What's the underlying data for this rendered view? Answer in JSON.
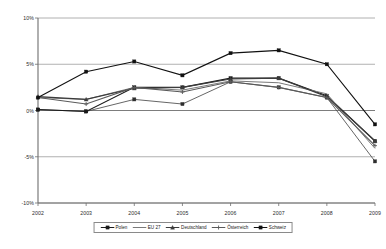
{
  "chart_data": {
    "type": "line",
    "title": "",
    "subtitle": "",
    "xlabel": "",
    "ylabel": "",
    "categories": [
      "2002",
      "2003",
      "2004",
      "2005",
      "2006",
      "2007",
      "2008",
      "2009"
    ],
    "x": [
      2002,
      2003,
      2004,
      2005,
      2006,
      2007,
      2008,
      2009
    ],
    "ylim": [
      -10,
      10
    ],
    "yticks": [
      10,
      5,
      0,
      -5,
      -10
    ],
    "ytick_labels": [
      "10%",
      "5%",
      "0%",
      "-5%",
      "-10%"
    ],
    "grid": true,
    "grid_axis": "y",
    "legend_position": "bottom",
    "series": [
      {
        "name": "Polen",
        "color": "#1a1a1a",
        "marker": "square",
        "values": [
          0.1,
          -0.1,
          2.5,
          2.5,
          3.5,
          3.5,
          1.6,
          -3.3
        ]
      },
      {
        "name": "EU 27",
        "color": "#7a7a7a",
        "marker": "none",
        "values": [
          1.4,
          1.2,
          2.5,
          2.2,
          3.2,
          3.0,
          1.8,
          -4.1
        ]
      },
      {
        "name": "Deutschland",
        "color": "#3c3c3c",
        "marker": "triangle",
        "values": [
          1.5,
          1.2,
          2.4,
          2.5,
          3.4,
          3.5,
          1.5,
          -3.3
        ]
      },
      {
        "name": "Österreich",
        "color": "#5a5a5a",
        "marker": "cross",
        "values": [
          1.4,
          0.7,
          2.5,
          2.0,
          3.1,
          2.5,
          1.4,
          -3.8
        ]
      },
      {
        "name": "Schweiz",
        "color": "#111111",
        "marker": "square",
        "values": [
          1.4,
          4.2,
          5.3,
          3.8,
          6.2,
          6.5,
          5.0,
          -1.5
        ]
      }
    ],
    "low_series": {
      "name": "Österreich-low",
      "values": [
        0.1,
        -0.1,
        1.2,
        0.7,
        3.1,
        2.5,
        1.4,
        -5.5
      ]
    }
  },
  "legend": {
    "entries": [
      {
        "label": "Polen"
      },
      {
        "label": "EU 27"
      },
      {
        "label": "Deutschland"
      },
      {
        "label": "Österreich"
      },
      {
        "label": "Schweiz"
      }
    ]
  }
}
